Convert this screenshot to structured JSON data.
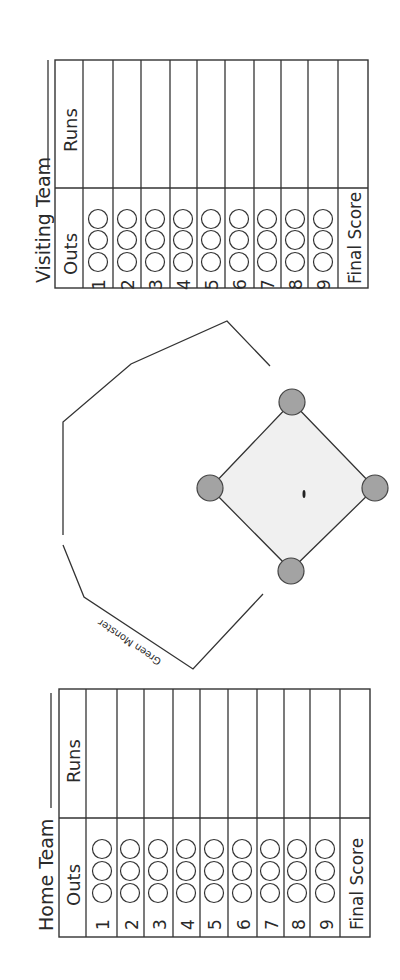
{
  "visiting": {
    "title": "Visiting Team",
    "runs_header": "Runs",
    "outs_header": "Outs",
    "innings": [
      "1",
      "2",
      "3",
      "4",
      "5",
      "6",
      "7",
      "8",
      "9"
    ],
    "final_label": "Final Score",
    "outs_per_inning": 3
  },
  "home": {
    "title": "Home Team",
    "runs_header": "Runs",
    "outs_header": "Outs",
    "innings": [
      "1",
      "2",
      "3",
      "4",
      "5",
      "6",
      "7",
      "8",
      "9"
    ],
    "final_label": "Final Score",
    "outs_per_inning": 3
  },
  "field": {
    "wall_label": "Green Monster",
    "infield_color": "#f0f0f0",
    "base_color": "#a3a3a3",
    "line_color": "#333333"
  }
}
